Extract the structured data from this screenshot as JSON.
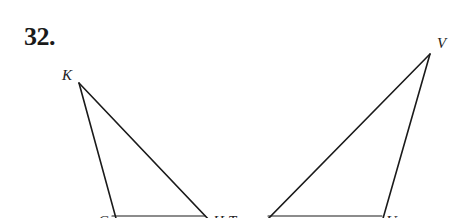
{
  "problem": {
    "number": "32."
  },
  "figure": {
    "line_color": "#1a1a1a",
    "labels": [
      {
        "id": "K",
        "text": "K",
        "x": 62,
        "y": 80
      },
      {
        "id": "V",
        "text": "V",
        "x": 437,
        "y": 48
      },
      {
        "id": "G",
        "text": "G",
        "x": 98,
        "y": 226
      },
      {
        "id": "H",
        "text": "H",
        "x": 213,
        "y": 226
      },
      {
        "id": "T",
        "text": "T",
        "x": 228,
        "y": 226
      },
      {
        "id": "U",
        "text": "U",
        "x": 386,
        "y": 226
      }
    ],
    "triangles": [
      {
        "name": "triangle-KGH",
        "vertices": [
          "K",
          "G",
          "H"
        ]
      },
      {
        "name": "triangle-VTU",
        "vertices": [
          "V",
          "T",
          "U"
        ]
      }
    ]
  }
}
